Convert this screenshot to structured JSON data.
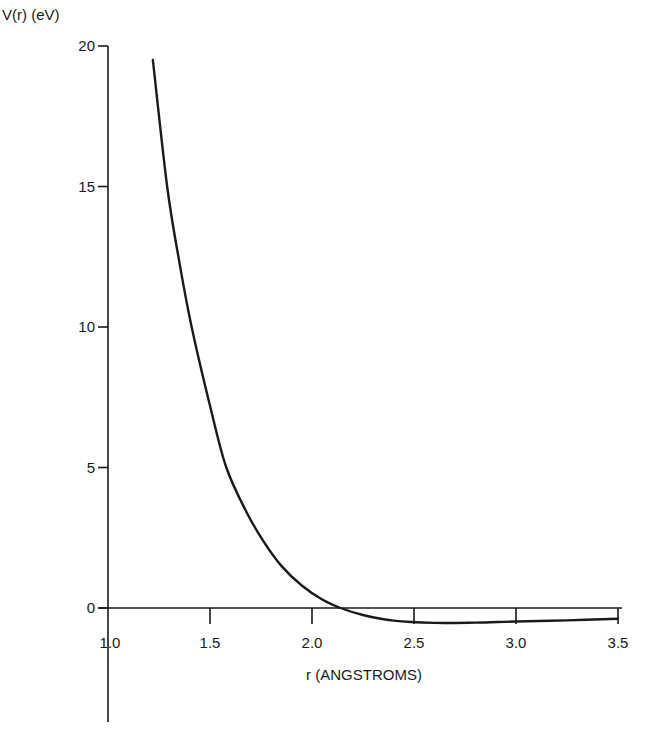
{
  "chart_data": {
    "type": "line",
    "title": "",
    "xlabel": "r (ANGSTROMS)",
    "ylabel": "V(r) (eV)",
    "xlim": [
      1.0,
      3.5
    ],
    "ylim": [
      0,
      20
    ],
    "grid": false,
    "legend": null,
    "x_ticks": [
      "1.0",
      "1.5",
      "2.0",
      "2.5",
      "3.0",
      "3.5"
    ],
    "y_ticks": [
      "0",
      "5",
      "10",
      "15",
      "20"
    ],
    "series": [
      {
        "name": "V(r)",
        "x": [
          1.22,
          1.29,
          1.35,
          1.41,
          1.5,
          1.58,
          1.68,
          1.76,
          1.85,
          1.95,
          2.05,
          2.14,
          2.25,
          2.4,
          2.6,
          2.8,
          3.0,
          3.25,
          3.5
        ],
        "values": [
          19.5,
          15.0,
          12.3,
          10.0,
          7.2,
          5.0,
          3.4,
          2.4,
          1.5,
          0.8,
          0.3,
          0.0,
          -0.25,
          -0.45,
          -0.53,
          -0.52,
          -0.48,
          -0.44,
          -0.38
        ]
      }
    ]
  }
}
